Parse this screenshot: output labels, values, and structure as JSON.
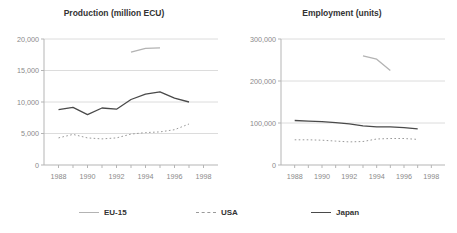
{
  "figure": {
    "legend": [
      {
        "label": "EU-15",
        "style": "solid-light"
      },
      {
        "label": "USA",
        "style": "dashed"
      },
      {
        "label": "Japan",
        "style": "solid-dark"
      }
    ],
    "colors": {
      "eu15": "#b3b3b3",
      "usa": "#9a9a9a",
      "japan": "#4a4a4a",
      "grid": "#dcdcdc",
      "axis": "#b5b5b5",
      "axis_text": "#8a8a8a",
      "title_text": "#333333"
    }
  },
  "chart_data": [
    {
      "type": "line",
      "title": "Production (million ECU)",
      "xlabel": "",
      "ylabel": "",
      "xlim": [
        1987,
        1999
      ],
      "ylim": [
        0,
        20000
      ],
      "xticks": [
        1988,
        1990,
        1992,
        1994,
        1996,
        1998
      ],
      "xtick_labels": [
        "1988",
        "1990",
        "1992",
        "1994",
        "1996",
        "1998"
      ],
      "yticks": [
        0,
        5000,
        10000,
        15000,
        20000
      ],
      "ytick_labels": [
        "0",
        "5,000",
        "10,000",
        "15,000",
        "20,000"
      ],
      "grid": true,
      "series": [
        {
          "name": "EU-15",
          "style": "solid-light",
          "x": [
            1993,
            1994,
            1995
          ],
          "values": [
            17900,
            18500,
            18600
          ]
        },
        {
          "name": "USA",
          "style": "dashed",
          "x": [
            1988,
            1989,
            1990,
            1991,
            1992,
            1993,
            1994,
            1995,
            1996,
            1997
          ],
          "values": [
            4300,
            4850,
            4300,
            4150,
            4300,
            4900,
            5150,
            5250,
            5600,
            6500
          ]
        },
        {
          "name": "Japan",
          "style": "solid-dark",
          "x": [
            1988,
            1989,
            1990,
            1991,
            1992,
            1993,
            1994,
            1995,
            1996,
            1997
          ],
          "values": [
            8800,
            9150,
            8000,
            9050,
            8850,
            10400,
            11250,
            11600,
            10600,
            10000
          ]
        }
      ]
    },
    {
      "type": "line",
      "title": "Employment (units)",
      "xlabel": "",
      "ylabel": "",
      "xlim": [
        1987,
        1999
      ],
      "ylim": [
        0,
        300000
      ],
      "xticks": [
        1988,
        1990,
        1992,
        1994,
        1996,
        1998
      ],
      "xtick_labels": [
        "1988",
        "1990",
        "1992",
        "1994",
        "1996",
        "1998"
      ],
      "yticks": [
        0,
        100000,
        200000,
        300000
      ],
      "ytick_labels": [
        "0",
        "100,000",
        "200,000",
        "300,000"
      ],
      "grid": true,
      "series": [
        {
          "name": "EU-15",
          "style": "solid-light",
          "x": [
            1993,
            1994,
            1995
          ],
          "values": [
            260000,
            252000,
            225000
          ]
        },
        {
          "name": "USA",
          "style": "dashed",
          "x": [
            1988,
            1989,
            1990,
            1991,
            1992,
            1993,
            1994,
            1995,
            1996,
            1997
          ],
          "values": [
            60000,
            60000,
            59000,
            57000,
            55000,
            56000,
            62000,
            63000,
            63000,
            61000
          ]
        },
        {
          "name": "Japan",
          "style": "solid-dark",
          "x": [
            1988,
            1989,
            1990,
            1991,
            1992,
            1993,
            1994,
            1995,
            1996,
            1997
          ],
          "values": [
            106000,
            104500,
            103000,
            101000,
            98000,
            93000,
            91000,
            91000,
            89000,
            86000
          ]
        }
      ]
    }
  ]
}
